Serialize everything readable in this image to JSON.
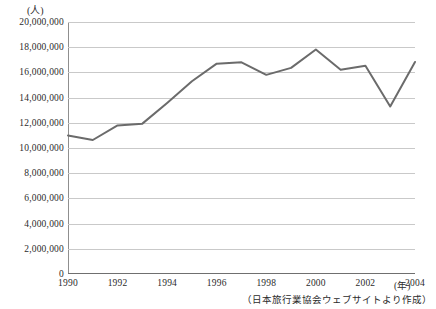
{
  "chart_data": {
    "type": "line",
    "title": "",
    "ylabel": "(人)",
    "xlabel": "(年)",
    "ylim": [
      0,
      20000000
    ],
    "xlim": [
      1990,
      2004
    ],
    "grid": true,
    "legend": "none",
    "line_color": "#6b6b6b",
    "x": [
      1990,
      1991,
      1992,
      1993,
      1994,
      1995,
      1996,
      1997,
      1998,
      1999,
      2000,
      2001,
      2002,
      2003,
      2004
    ],
    "values": [
      10997000,
      10634000,
      11791000,
      11934000,
      13579000,
      15298000,
      16695000,
      16803000,
      15806000,
      16358000,
      17819000,
      16216000,
      16523000,
      13296000,
      16831000
    ],
    "categories": [
      "1990",
      "1991",
      "1992",
      "1993",
      "1994",
      "1995",
      "1996",
      "1997",
      "1998",
      "1999",
      "2000",
      "2001",
      "2002",
      "2003",
      "2004"
    ],
    "ytick_labels": [
      "20,000,000",
      "18,000,000",
      "16,000,000",
      "14,000,000",
      "12,000,000",
      "10,000,000",
      "8,000,000",
      "6,000,000",
      "4,000,000",
      "2,000,000",
      "0"
    ],
    "ytick_values": [
      20000000,
      18000000,
      16000000,
      14000000,
      12000000,
      10000000,
      8000000,
      6000000,
      4000000,
      2000000,
      0
    ],
    "xtick_labels": [
      "1990",
      "1992",
      "1994",
      "1996",
      "1998",
      "2000",
      "2002",
      "2004"
    ],
    "xtick_values": [
      1990,
      1992,
      1994,
      1996,
      1998,
      2000,
      2002,
      2004
    ],
    "annotation_source": "（日本旅行業協会ウェブサイトより作成）"
  }
}
